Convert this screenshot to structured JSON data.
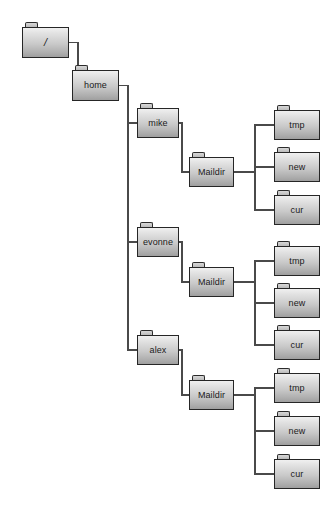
{
  "diagram": {
    "type": "tree",
    "background_color": "#ffffff",
    "node_fill_top": "#f0f0f0",
    "node_fill_bottom": "#9f9f9f",
    "node_border_color": "#262626",
    "connector_color": "#4a4a4a",
    "label_color": "#1a1a1a"
  },
  "nodes": [
    {
      "id": "root",
      "label": "/",
      "x": 22,
      "y": 22,
      "w": 47,
      "h": 31,
      "icon": "folder-icon",
      "depth": 0
    },
    {
      "id": "home",
      "label": "home",
      "x": 72,
      "y": 65,
      "w": 47,
      "h": 31,
      "icon": "folder-icon",
      "depth": 1
    },
    {
      "id": "mike",
      "label": "mike",
      "x": 137,
      "y": 103,
      "w": 42,
      "h": 30,
      "icon": "folder-icon",
      "depth": 2
    },
    {
      "id": "mike-maildir",
      "label": "Maildir",
      "x": 189,
      "y": 152,
      "w": 45,
      "h": 30,
      "icon": "folder-icon",
      "depth": 3
    },
    {
      "id": "mike-tmp",
      "label": "tmp",
      "x": 274,
      "y": 105,
      "w": 46,
      "h": 30,
      "icon": "folder-icon",
      "depth": 4
    },
    {
      "id": "mike-new",
      "label": "new",
      "x": 274,
      "y": 147,
      "w": 46,
      "h": 30,
      "icon": "folder-icon",
      "depth": 4
    },
    {
      "id": "mike-cur",
      "label": "cur",
      "x": 274,
      "y": 190,
      "w": 46,
      "h": 30,
      "icon": "folder-icon",
      "depth": 4
    },
    {
      "id": "evonne",
      "label": "evonne",
      "x": 137,
      "y": 222,
      "w": 42,
      "h": 30,
      "icon": "folder-icon",
      "depth": 2
    },
    {
      "id": "evonne-maildir",
      "label": "Maildir",
      "x": 189,
      "y": 262,
      "w": 45,
      "h": 30,
      "icon": "folder-icon",
      "depth": 3
    },
    {
      "id": "evonne-tmp",
      "label": "tmp",
      "x": 274,
      "y": 241,
      "w": 46,
      "h": 30,
      "icon": "folder-icon",
      "depth": 4
    },
    {
      "id": "evonne-new",
      "label": "new",
      "x": 274,
      "y": 283,
      "w": 46,
      "h": 30,
      "icon": "folder-icon",
      "depth": 4
    },
    {
      "id": "evonne-cur",
      "label": "cur",
      "x": 274,
      "y": 325,
      "w": 46,
      "h": 30,
      "icon": "folder-icon",
      "depth": 4
    },
    {
      "id": "alex",
      "label": "alex",
      "x": 137,
      "y": 330,
      "w": 42,
      "h": 30,
      "icon": "folder-icon",
      "depth": 2
    },
    {
      "id": "alex-maildir",
      "label": "Maildir",
      "x": 189,
      "y": 375,
      "w": 45,
      "h": 30,
      "icon": "folder-icon",
      "depth": 3
    },
    {
      "id": "alex-tmp",
      "label": "tmp",
      "x": 274,
      "y": 368,
      "w": 46,
      "h": 30,
      "icon": "folder-icon",
      "depth": 4
    },
    {
      "id": "alex-new",
      "label": "new",
      "x": 274,
      "y": 411,
      "w": 46,
      "h": 30,
      "icon": "folder-icon",
      "depth": 4
    },
    {
      "id": "alex-cur",
      "label": "cur",
      "x": 274,
      "y": 454,
      "w": 46,
      "h": 30,
      "icon": "folder-icon",
      "depth": 4
    }
  ],
  "edges": [
    {
      "from": "root",
      "to": "home",
      "elbow_x": 78
    },
    {
      "from": "home",
      "to": "mike",
      "elbow_x": 128
    },
    {
      "from": "home",
      "to": "evonne",
      "elbow_x": 128
    },
    {
      "from": "home",
      "to": "alex",
      "elbow_x": 128
    },
    {
      "from": "mike",
      "to": "mike-maildir",
      "elbow_x": 182
    },
    {
      "from": "evonne",
      "to": "evonne-maildir",
      "elbow_x": 182
    },
    {
      "from": "alex",
      "to": "alex-maildir",
      "elbow_x": 182
    },
    {
      "from": "mike-maildir",
      "to": "mike-tmp",
      "elbow_x": 255
    },
    {
      "from": "mike-maildir",
      "to": "mike-new",
      "elbow_x": 255
    },
    {
      "from": "mike-maildir",
      "to": "mike-cur",
      "elbow_x": 255
    },
    {
      "from": "evonne-maildir",
      "to": "evonne-tmp",
      "elbow_x": 255
    },
    {
      "from": "evonne-maildir",
      "to": "evonne-new",
      "elbow_x": 255
    },
    {
      "from": "evonne-maildir",
      "to": "evonne-cur",
      "elbow_x": 255
    },
    {
      "from": "alex-maildir",
      "to": "alex-tmp",
      "elbow_x": 255
    },
    {
      "from": "alex-maildir",
      "to": "alex-new",
      "elbow_x": 255
    },
    {
      "from": "alex-maildir",
      "to": "alex-cur",
      "elbow_x": 255
    }
  ]
}
